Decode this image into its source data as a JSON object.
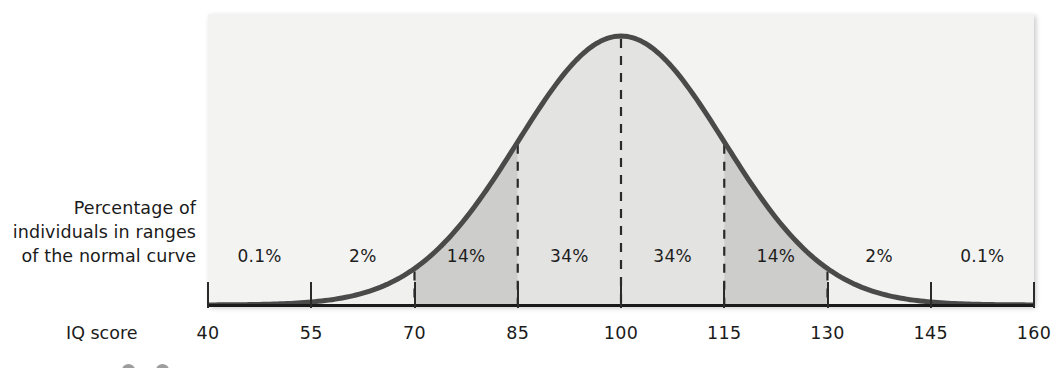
{
  "figure": {
    "y_axis_caption_lines": [
      "Percentage of",
      "individuals in ranges",
      "of the normal curve"
    ],
    "x_axis_name": "IQ score"
  },
  "chart_data": {
    "type": "area",
    "title": "",
    "subtitle": "",
    "xlabel": "IQ score",
    "ylabel": "Percentage of individuals in ranges of the normal curve",
    "distribution": "normal",
    "mean": 100,
    "std_dev": 15,
    "xlim": [
      40,
      160
    ],
    "grid": false,
    "legend": null,
    "tick_labels": [
      "40",
      "55",
      "70",
      "85",
      "100",
      "115",
      "130",
      "145",
      "160"
    ],
    "tick_values": [
      40,
      55,
      70,
      85,
      100,
      115,
      130,
      145,
      160
    ],
    "bands": [
      {
        "label": "0.1%",
        "value": 0.1,
        "from": 40,
        "to": 55,
        "center": 47.5,
        "shade": "#f0f0ef"
      },
      {
        "label": "2%",
        "value": 2,
        "from": 55,
        "to": 70,
        "center": 62.5,
        "shade": "#f0f0ef"
      },
      {
        "label": "14%",
        "value": 14,
        "from": 70,
        "to": 85,
        "center": 77.5,
        "shade": "#cdcdcb"
      },
      {
        "label": "34%",
        "value": 34,
        "from": 85,
        "to": 100,
        "center": 92.5,
        "shade": "#e3e3e1"
      },
      {
        "label": "34%",
        "value": 34,
        "from": 100,
        "to": 115,
        "center": 107.5,
        "shade": "#e3e3e1"
      },
      {
        "label": "14%",
        "value": 14,
        "from": 115,
        "to": 130,
        "center": 122.5,
        "shade": "#cdcdcb"
      },
      {
        "label": "2%",
        "value": 2,
        "from": 130,
        "to": 145,
        "center": 137.5,
        "shade": "#f0f0ef"
      },
      {
        "label": "0.1%",
        "value": 0.1,
        "from": 145,
        "to": 160,
        "center": 152.5,
        "shade": "#f0f0ef"
      }
    ],
    "dashed_dividers": [
      70,
      85,
      100,
      115,
      130
    ],
    "colors": {
      "curve": "#4a4a4a",
      "panel_background": "#f3f3f2",
      "band_dark": "#cdcdcb",
      "band_mid": "#e3e3e1",
      "axis": "#1a1a1a",
      "text": "#1b1b1b"
    }
  }
}
